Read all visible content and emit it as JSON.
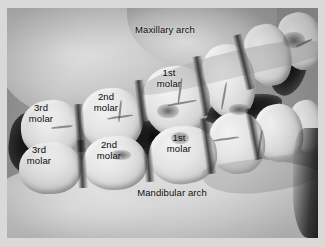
{
  "figure": {
    "type": "anatomical-photograph",
    "color_mode": "grayscale",
    "border_color": "#d9d9d9",
    "label_color": "#0a0a0a"
  },
  "labels": {
    "maxillary_arch": "Maxillary arch",
    "mandibular_arch": "Mandibular arch",
    "upper_third_molar": "3rd\nmolar",
    "upper_second_molar": "2nd\nmolar",
    "upper_first_molar": "1st\nmolar",
    "lower_third_molar": "3rd\nmolar",
    "lower_second_molar": "2nd\nmolar",
    "lower_first_molar": "1st\nmolar"
  }
}
